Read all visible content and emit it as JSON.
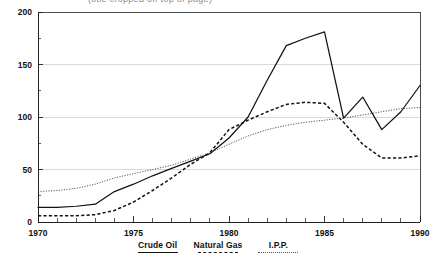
{
  "figure": {
    "title_clipped": "(title cropped off top of page)",
    "background": "#ffffff"
  },
  "chart_data": {
    "type": "line",
    "title": "",
    "xlabel": "",
    "ylabel": "",
    "xlim": [
      1970,
      1990
    ],
    "ylim": [
      0,
      200
    ],
    "grid": "horizontal-major",
    "legend_position": "bottom-center",
    "x": [
      1970,
      1971,
      1972,
      1973,
      1974,
      1975,
      1976,
      1977,
      1978,
      1979,
      1980,
      1981,
      1982,
      1983,
      1984,
      1985,
      1986,
      1987,
      1988,
      1989,
      1990
    ],
    "y_ticks": [
      0,
      50,
      100,
      150,
      200
    ],
    "y_minor_ticks": [
      25,
      75,
      125,
      175
    ],
    "x_ticks": [
      1970,
      1975,
      1980,
      1985,
      1990
    ],
    "x_tick_labels": [
      "1970",
      "1975",
      "1980",
      "1985",
      "1990"
    ],
    "y_tick_labels": [
      "0",
      "50",
      "100",
      "150",
      "200"
    ],
    "series": [
      {
        "name": "Crude Oil",
        "style": "solid",
        "color": "#111111",
        "values": [
          14,
          14,
          15,
          17,
          29,
          36,
          44,
          51,
          58,
          65,
          80,
          100,
          135,
          168,
          175,
          181,
          99,
          119,
          88,
          105,
          130
        ]
      },
      {
        "name": "Natural Gas",
        "style": "dashed",
        "color": "#111111",
        "values": [
          6,
          6,
          6,
          7,
          11,
          19,
          30,
          42,
          55,
          66,
          88,
          97,
          105,
          112,
          114,
          113,
          95,
          74,
          61,
          61,
          63
        ]
      },
      {
        "name": "I.P.P.",
        "style": "dotted",
        "color": "#4a4a4a",
        "values": [
          29,
          30,
          32,
          36,
          42,
          46,
          50,
          54,
          60,
          66,
          74,
          82,
          88,
          92,
          95,
          97,
          99,
          102,
          105,
          108,
          109
        ]
      }
    ]
  },
  "legend": {
    "items": [
      {
        "label": "Crude Oil",
        "style": "solid"
      },
      {
        "label": "Natural Gas",
        "style": "dashed"
      },
      {
        "label": "I.P.P.",
        "style": "dotted"
      }
    ]
  }
}
